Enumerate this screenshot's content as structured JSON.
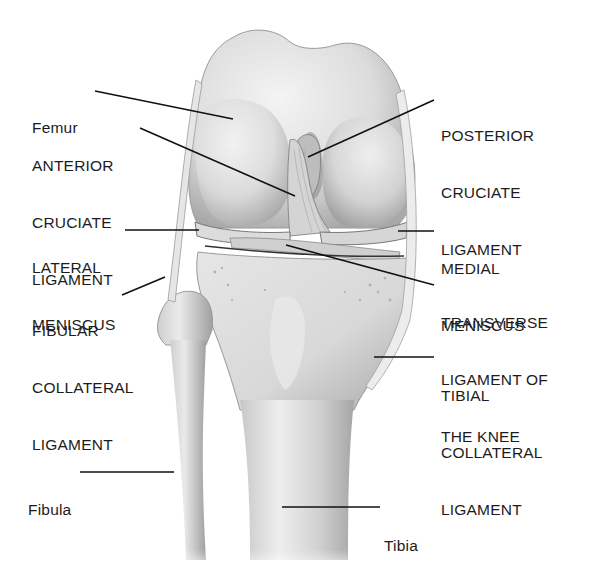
{
  "figure": {
    "colors": {
      "bone": "#e2e2e2",
      "bone_shadow": "#9a9a9a",
      "ligament": "#cfcfcf",
      "line": "#111111",
      "background": "#ffffff"
    }
  },
  "labels": {
    "femur": {
      "lines": [
        "Femur"
      ]
    },
    "acl": {
      "lines": [
        "ANTERIOR",
        "CRUCIATE",
        "LIGAMENT"
      ]
    },
    "lateral_meniscus": {
      "lines": [
        "LATERAL",
        "MENISCUS"
      ]
    },
    "fibular_collateral": {
      "lines": [
        "FIBULAR",
        "COLLATERAL",
        "LIGAMENT"
      ]
    },
    "fibula": {
      "lines": [
        "Fibula"
      ]
    },
    "pcl": {
      "lines": [
        "POSTERIOR",
        "CRUCIATE",
        "LIGAMENT"
      ]
    },
    "medial_meniscus": {
      "lines": [
        "MEDIAL",
        "MENISCUS"
      ]
    },
    "transverse": {
      "lines": [
        "TRANSVERSE",
        "LIGAMENT OF",
        "THE KNEE"
      ]
    },
    "tibial_collateral": {
      "lines": [
        "TIBIAL",
        "COLLATERAL",
        "LIGAMENT"
      ]
    },
    "tibia": {
      "lines": [
        "Tibia"
      ]
    }
  }
}
